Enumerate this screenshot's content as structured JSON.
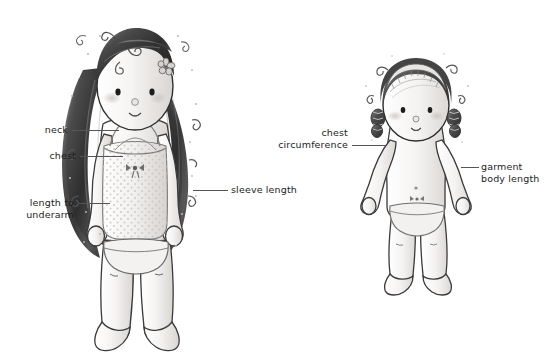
{
  "diagram": {
    "background_color": "#ffffff",
    "line_color": "#555555",
    "text_color": "#1d1d1d",
    "figures": [
      {
        "name": "left-figure",
        "description": "Girl doll with long dark hair, flower hair clip, polka-dot camisole and briefs"
      },
      {
        "name": "right-figure",
        "description": "Smaller doll with headband, side curls, bare chest and briefs"
      }
    ]
  },
  "labels": {
    "neck": "neck",
    "chest": "chest",
    "length_to_underarm": "length to\nunderarm",
    "sleeve_length": "sleeve length",
    "chest_circumference": "chest\ncircumference",
    "garment_body_length": "garment\nbody length"
  },
  "colors": {
    "hair_dark": "#3a3a3a",
    "hair_mid": "#6e6e6e",
    "skin": "#f2f0ee",
    "skin_shade": "#dedbd8",
    "outline": "#2b2b2b",
    "leader_line": "#555555",
    "garment": "#eceaea",
    "garment_line": "#8a8a8a"
  }
}
